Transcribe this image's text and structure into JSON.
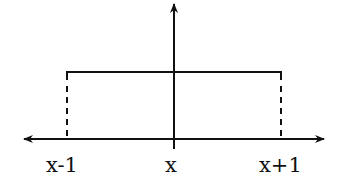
{
  "diagram": {
    "labels": {
      "left": "x-1",
      "center": "x",
      "right": "x+1"
    },
    "colors": {
      "stroke": "#111111",
      "background": "#ffffff"
    },
    "geometry": {
      "axis_y": 139,
      "vaxis_x": 174,
      "box_left_x": 67,
      "box_right_x": 281,
      "box_top_y": 72
    }
  }
}
